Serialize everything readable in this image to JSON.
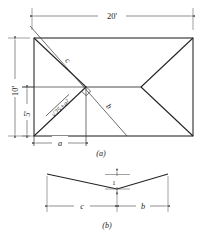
{
  "figure": {
    "panels": [
      {
        "id": "a",
        "caption": "(a)",
        "name": "plan-view",
        "dimensions": [
          {
            "label": "20'",
            "name": "overall-width-dimension",
            "orientation": "horizontal",
            "position": "top"
          },
          {
            "label": "10'",
            "name": "overall-height-dimension",
            "orientation": "vertical",
            "position": "left-outer"
          },
          {
            "label": "5'",
            "name": "half-height-dimension",
            "orientation": "vertical",
            "position": "left-inner"
          },
          {
            "label": "a",
            "name": "a-dimension",
            "orientation": "horizontal",
            "position": "bottom"
          }
        ],
        "annotations": [
          {
            "label": "c",
            "name": "label-c",
            "description": "upper construction diagonal"
          },
          {
            "label": "b",
            "name": "label-b",
            "description": "lower construction diagonal"
          },
          {
            "label": "√25+a²",
            "name": "label-hypotenuse",
            "description": "hip rafter length expression"
          }
        ],
        "markers": [
          {
            "name": "right-angle-marker",
            "label": ""
          }
        ]
      },
      {
        "id": "b",
        "caption": "(b)",
        "name": "profile-view",
        "dimensions": [
          {
            "label": "1",
            "name": "unit-rise-dimension",
            "orientation": "vertical",
            "position": "center"
          },
          {
            "label": "c",
            "name": "c-run-dimension",
            "orientation": "horizontal",
            "position": "left"
          },
          {
            "label": "b",
            "name": "b-run-dimension",
            "orientation": "horizontal",
            "position": "right"
          }
        ]
      }
    ],
    "colors": {
      "line": "#222222",
      "dimension": "#444444",
      "background": "#ffffff"
    }
  }
}
